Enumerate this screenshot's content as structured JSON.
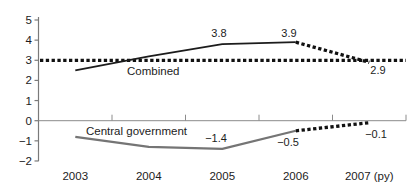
{
  "chart_data": {
    "type": "line",
    "title": "",
    "xlabel": "",
    "ylabel": "",
    "categories": [
      "2003",
      "2004",
      "2005",
      "2006",
      "2007 (py)"
    ],
    "ylim": [
      -2,
      5
    ],
    "yticks": [
      5,
      4,
      3,
      2,
      1,
      0,
      -1,
      -2
    ],
    "ytick_labels": [
      "5",
      "4",
      "3",
      "2",
      "1",
      "0",
      "−1",
      "−2"
    ],
    "grid": false,
    "legend": "inline-labels",
    "axis_color": "#7a7a7a",
    "text_color": "#1c1c1c",
    "series": [
      {
        "name": "Combined",
        "values": [
          2.5,
          3.2,
          3.8,
          3.9,
          null
        ],
        "color": "#1c1c1c",
        "style": "solid",
        "width": 1.8
      },
      {
        "name": "Combined projection",
        "values": [
          null,
          null,
          null,
          3.9,
          2.9
        ],
        "color": "#111111",
        "style": "dotted",
        "width": 3.3
      },
      {
        "name": "Central government",
        "values": [
          -0.8,
          -1.3,
          -1.4,
          -0.5,
          null
        ],
        "color": "#757575",
        "style": "solid",
        "width": 2.2
      },
      {
        "name": "Central government projection",
        "values": [
          null,
          null,
          null,
          -0.5,
          -0.1
        ],
        "color": "#111111",
        "style": "dotted",
        "width": 3.3
      }
    ],
    "reference_line": {
      "value": 3,
      "color": "#111111",
      "style": "dotted",
      "width": 3.3
    },
    "series_labels": [
      {
        "text": "Combined",
        "px": 127,
        "py": 75,
        "anchor": "start"
      },
      {
        "text": "Central government",
        "px": 86,
        "py": 135,
        "anchor": "start"
      }
    ],
    "data_labels": [
      {
        "text": "3.8",
        "px": 219,
        "py": 37,
        "anchor": "middle"
      },
      {
        "text": "3.9",
        "px": 289,
        "py": 37,
        "anchor": "middle"
      },
      {
        "text": "2.9",
        "px": 378,
        "py": 74,
        "anchor": "middle"
      },
      {
        "text": "−1.4",
        "px": 216,
        "py": 142,
        "anchor": "middle"
      },
      {
        "text": "−0.5",
        "px": 288,
        "py": 146,
        "anchor": "middle"
      },
      {
        "text": "−0.1",
        "px": 376,
        "py": 138,
        "anchor": "middle"
      }
    ]
  }
}
